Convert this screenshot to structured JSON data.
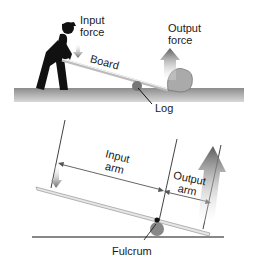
{
  "top_scene": {
    "labels": {
      "input_force_1": "Input",
      "input_force_2": "force",
      "output_force_1": "Output",
      "output_force_2": "force",
      "board": "Board",
      "log": "Log"
    }
  },
  "bottom_diagram": {
    "labels": {
      "input_arm_1": "Input",
      "input_arm_2": "arm",
      "output_arm_1": "Output",
      "output_arm_2": "arm",
      "fulcrum": "Fulcrum"
    }
  },
  "colors": {
    "ground": "#9a9a9a",
    "board": "#e6e6e6",
    "arrow": "#6e6e6e",
    "text": "#1a1a1a"
  }
}
